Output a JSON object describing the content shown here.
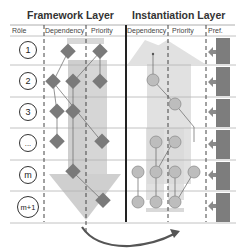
{
  "titles": {
    "framework": "Framework Layer",
    "instantiation": "Instantiation Layer"
  },
  "headers": {
    "role": "Rôle",
    "fw_dependency": "Dependency",
    "fw_priority": "Priority",
    "in_dependency": "Dependency",
    "in_priority": "Priority",
    "pref": "Pref."
  },
  "roles": [
    "1",
    "2",
    "3",
    "...",
    "m",
    "m+1"
  ],
  "colors": {
    "diamond": "#7a7a7a",
    "circle_fill": "#bdbdbd",
    "circle_stroke": "#8e8e8e",
    "arrow_light": "#d9d9d9",
    "bar_light": "#d0d0d0",
    "pref_bar": "#7d7d7d",
    "grid_line": "#b0b0b0",
    "text": "#333333"
  },
  "framework_arrow": {
    "direction": "down"
  },
  "instantiation_arrow": {
    "direction": "up"
  },
  "transfer_arrow": {
    "from": "Framework Layer",
    "to": "Instantiation Layer"
  }
}
